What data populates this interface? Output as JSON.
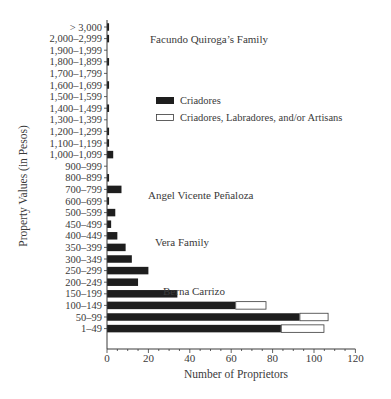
{
  "chart_data": {
    "type": "bar",
    "orientation": "horizontal",
    "stacked": true,
    "title": "",
    "xlabel": "Number of Proprietors",
    "ylabel": "Property Values (in Pesos)",
    "xlim": [
      0,
      120
    ],
    "xticks": [
      0,
      20,
      40,
      60,
      80,
      100,
      120
    ],
    "grid": false,
    "categories": [
      "> 3,000",
      "2,000–2,999",
      "1,900–1,999",
      "1,800–1,899",
      "1,700–1,799",
      "1,600–1,699",
      "1,500–1,599",
      "1,400–1,499",
      "1,300–1,399",
      "1,200–1,299",
      "1,100–1,199",
      "1,000–1,099",
      "900–999",
      "800–899",
      "700–799",
      "600–699",
      "500–599",
      "450–499",
      "400–449",
      "350–399",
      "300–349",
      "250–299",
      "200–249",
      "150–199",
      "100–149",
      "50–99",
      "1–49"
    ],
    "series": [
      {
        "name": "Criadores",
        "color": "#1e1e1e",
        "values": [
          1,
          1,
          0,
          1,
          0,
          1,
          0,
          1,
          0,
          1,
          1,
          3,
          0,
          1,
          7,
          1,
          4,
          2,
          5,
          9,
          12,
          20,
          15,
          34,
          62,
          93,
          84
        ]
      },
      {
        "name": "Criadores, Labradores, and/or Artisans",
        "color": "#ffffff",
        "values": [
          0,
          0,
          0,
          0,
          0,
          0,
          0,
          0,
          0,
          0,
          0,
          0,
          0,
          0,
          0,
          0,
          0,
          0,
          0,
          0,
          0,
          0,
          0,
          0,
          15,
          14,
          21
        ]
      }
    ],
    "legend": {
      "position": "upper right (inside plot)",
      "entries": [
        "Criadores",
        "Criadores, Labradores, and/or Artisans"
      ]
    },
    "annotations": [
      {
        "text": "Facundo Quiroga’s Family",
        "near_category": "2,000–2,999"
      },
      {
        "text": "Angel Vicente Peñaloza",
        "near_category": "700–799"
      },
      {
        "text": "Vera Family",
        "near_category": "400–449"
      },
      {
        "text": "Berna Carrizo",
        "near_category": "200–249"
      }
    ]
  }
}
